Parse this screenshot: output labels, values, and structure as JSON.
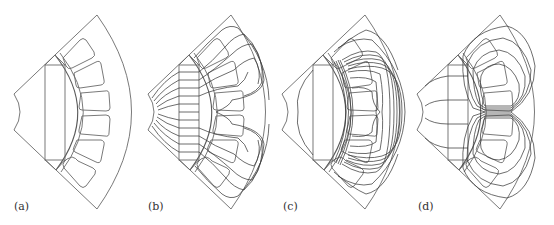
{
  "figure": {
    "colors": {
      "background": "#ffffff",
      "geometry_stroke": "#6a6a6a",
      "flux_stroke": "#3c3c3c",
      "label_text": "#333333"
    },
    "panels": [
      {
        "id": "a",
        "label": "(a)",
        "content": "geometry only (no flux lines)"
      },
      {
        "id": "b",
        "label": "(b)",
        "content": "flux lines from permanent magnet"
      },
      {
        "id": "c",
        "label": "(c)",
        "content": "flux lines from d-axis current"
      },
      {
        "id": "d",
        "label": "(d)",
        "content": "flux lines from q-axis current"
      }
    ]
  }
}
